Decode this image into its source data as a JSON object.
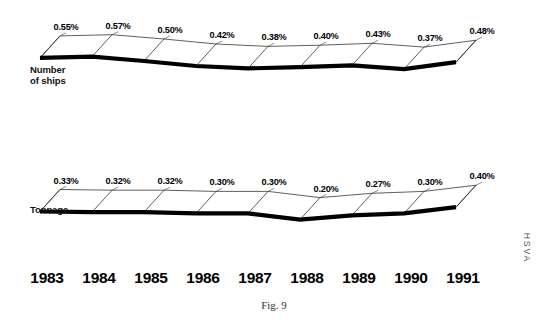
{
  "figure": {
    "caption": "Fig. 9",
    "margin_text": "HSVA",
    "background_color": "#ffffff",
    "ink_color": "#000000"
  },
  "chart_data": {
    "type": "line",
    "title": "Fig. 9",
    "xlabel": "",
    "ylabel": "",
    "grid": false,
    "legend_position": "inline-left",
    "categories": [
      "1983",
      "1984",
      "1985",
      "1986",
      "1987",
      "1988",
      "1989",
      "1990",
      "1991"
    ],
    "series": [
      {
        "name": "Number of ships",
        "unit": "%",
        "values": [
          0.55,
          0.57,
          0.5,
          0.42,
          0.38,
          0.4,
          0.43,
          0.37,
          0.48
        ],
        "labels": [
          "0.55%",
          "0.57%",
          "0.50%",
          "0.42%",
          "0.38%",
          "0.40%",
          "0.43%",
          "0.37%",
          "0.48%"
        ]
      },
      {
        "name": "Tonnage",
        "unit": "%",
        "values": [
          0.33,
          0.32,
          0.32,
          0.3,
          0.3,
          0.2,
          0.27,
          0.3,
          0.4
        ],
        "labels": [
          "0.33%",
          "0.32%",
          "0.32%",
          "0.30%",
          "0.30%",
          "0.20%",
          "0.27%",
          "0.30%",
          "0.40%"
        ]
      }
    ],
    "ylim": [
      0.0,
      0.62
    ]
  },
  "geometry": {
    "comment_free": true,
    "x_start": 40,
    "x_step": 52,
    "depth_dx": 20,
    "depth_dy": -22,
    "ships": {
      "baseline_y": 92,
      "scale": 62,
      "label_dx": 6,
      "label_dy": -6
    },
    "tonnage": {
      "baseline_y": 232,
      "scale": 62,
      "label_dx": 6,
      "label_dy": -6
    }
  },
  "axis": {
    "years_y": 283,
    "year_positions": [
      47,
      99,
      151,
      203,
      255,
      307,
      359,
      411,
      463
    ]
  },
  "caption": {
    "x": 274,
    "y": 309
  },
  "margin": {
    "x": 524,
    "y": 248
  },
  "series_name_labels": [
    {
      "name": "Number of ships",
      "lines": [
        "Number",
        "of ships"
      ],
      "x": 30,
      "y": 73
    },
    {
      "name": "Tonnage",
      "lines": [
        "Tonnage"
      ],
      "x": 30,
      "y": 213
    }
  ]
}
